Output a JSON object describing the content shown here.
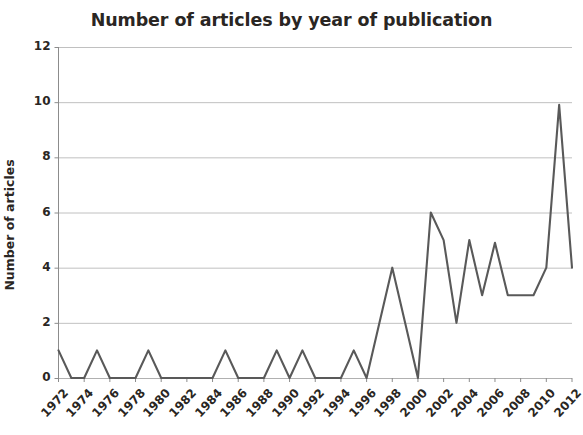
{
  "chart_data": {
    "type": "line",
    "title": "Number of articles by year of publication",
    "xlabel": "",
    "ylabel": "Number of articles",
    "ylim": [
      0,
      12
    ],
    "xlim": [
      1972,
      2012
    ],
    "ytick_labels": [
      "12",
      "10",
      "8",
      "6",
      "4",
      "2",
      "0"
    ],
    "ytick_values": [
      12,
      10,
      8,
      6,
      4,
      2,
      0
    ],
    "xtick_labels": [
      "1972",
      "1974",
      "1976",
      "1978",
      "1980",
      "1982",
      "1984",
      "1986",
      "1988",
      "1990",
      "1992",
      "1994",
      "1996",
      "1998",
      "2000",
      "2002",
      "2004",
      "2006",
      "2008",
      "2010",
      "2012"
    ],
    "xtick_values": [
      1972,
      1974,
      1976,
      1978,
      1980,
      1982,
      1984,
      1986,
      1988,
      1990,
      1992,
      1994,
      1996,
      1998,
      2000,
      2002,
      2004,
      2006,
      2008,
      2010,
      2012
    ],
    "grid": "horizontal",
    "legend": "none",
    "line_color": "#595959",
    "x": [
      1972,
      1973,
      1974,
      1975,
      1976,
      1977,
      1978,
      1979,
      1980,
      1981,
      1982,
      1983,
      1984,
      1985,
      1986,
      1987,
      1988,
      1989,
      1990,
      1991,
      1992,
      1993,
      1994,
      1995,
      1996,
      1997,
      1998,
      1999,
      2000,
      2001,
      2002,
      2003,
      2004,
      2005,
      2006,
      2007,
      2008,
      2009,
      2010,
      2011,
      2012
    ],
    "values": [
      1,
      0,
      0,
      1,
      0,
      0,
      0,
      1,
      0,
      0,
      0,
      0,
      0,
      1,
      0,
      0,
      0,
      1,
      0,
      1,
      0,
      0,
      0,
      1,
      0,
      2,
      4,
      2,
      0,
      6,
      5,
      2,
      5,
      3,
      4.9,
      3,
      3,
      3,
      4,
      9.9,
      4
    ],
    "series": [
      {
        "name": "Number of articles",
        "values": [
          1,
          0,
          0,
          1,
          0,
          0,
          0,
          1,
          0,
          0,
          0,
          0,
          0,
          1,
          0,
          0,
          0,
          1,
          0,
          1,
          0,
          0,
          0,
          1,
          0,
          2,
          4,
          2,
          0,
          6,
          5,
          2,
          5,
          3,
          4.9,
          3,
          3,
          3,
          4,
          9.9,
          4
        ]
      }
    ]
  }
}
